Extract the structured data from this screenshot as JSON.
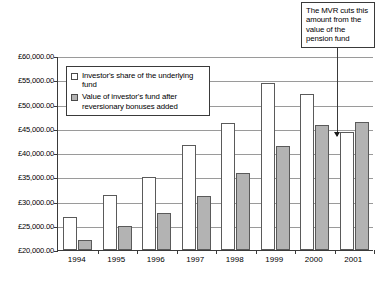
{
  "chart_data": {
    "type": "bar",
    "title": "",
    "xlabel": "",
    "ylabel": "",
    "categories": [
      "1994",
      "1995",
      "1996",
      "1997",
      "1998",
      "1999",
      "2000",
      "2001"
    ],
    "series": [
      {
        "name": "Investor's share of the underlying fund",
        "color": "#ffffff",
        "values": [
          26800,
          31400,
          35000,
          41600,
          46100,
          54400,
          52100,
          44300
        ]
      },
      {
        "name": "Value of investor's fund after reversionary bonuses added",
        "color": "#b3b3b3",
        "values": [
          22100,
          24900,
          27600,
          31100,
          35900,
          41400,
          45700,
          46300
        ]
      }
    ],
    "ylim": [
      20000,
      60000
    ],
    "ytick_values": [
      20000,
      25000,
      30000,
      35000,
      40000,
      45000,
      50000,
      55000,
      60000
    ],
    "ytick_labels": [
      "£20,000.00",
      "£25,000.00",
      "£30,000.00",
      "£35,000.00",
      "£40,000.00",
      "£45,000.00",
      "£50,000.00",
      "£55,000.00",
      "£60,000.00"
    ],
    "grid": true,
    "legend_position": "upper-left-inside"
  },
  "legend": {
    "entries": [
      {
        "label": "Investor's share of the underlying fund",
        "swatch": "s0"
      },
      {
        "label": "Value of investor's fund after reversionary bonuses added",
        "swatch": "s1"
      }
    ]
  },
  "annotation": {
    "text": "The MVR cuts this amount from the value of the pension fund",
    "points_to": "2001"
  }
}
